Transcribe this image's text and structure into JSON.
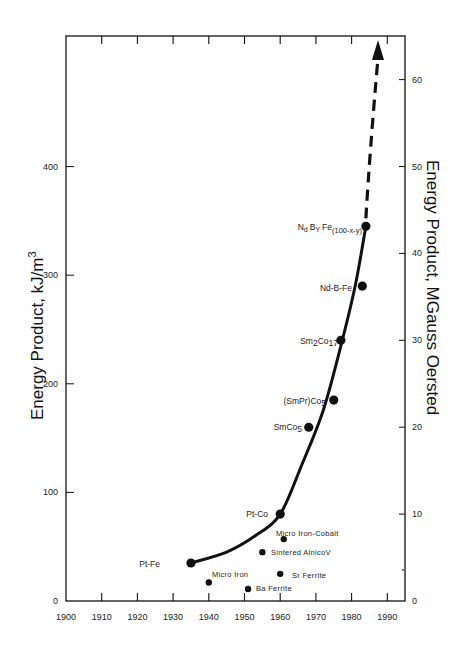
{
  "chart_data": {
    "type": "scatter",
    "title": "",
    "xlabel": "",
    "ylabel": "Energy Product, kJ/m³",
    "ylabel_base": "Energy Product, kJ/m",
    "ylabel_sup": "3",
    "ylabel_right": "Energy Product, MGauss Oersted",
    "xlim": [
      1900,
      1995
    ],
    "ylim": [
      0,
      520
    ],
    "ylim_right": [
      0,
      65
    ],
    "grid": false,
    "legend": "none",
    "x_ticks": [
      1900,
      1910,
      1920,
      1930,
      1940,
      1950,
      1960,
      1970,
      1980,
      1990
    ],
    "y_ticks_left": [
      0,
      100,
      200,
      300,
      400
    ],
    "y_ticks_right": [
      0,
      10,
      20,
      30,
      40,
      50,
      60
    ],
    "series": [
      {
        "name": "Trend curve materials",
        "on_curve": true,
        "points": [
          {
            "label": "Pt-Fe",
            "x": 1935,
            "y": 35
          },
          {
            "label": "Pt-Co",
            "x": 1960,
            "y": 80
          },
          {
            "label": "SmCo5",
            "label_main": "SmCo",
            "label_sub": "5",
            "x": 1968,
            "y": 160
          },
          {
            "label": "(SmPr)Co5",
            "label_main": "(SmPr)Co",
            "label_sub": "5",
            "x": 1975,
            "y": 185
          },
          {
            "label": "Sm2Co17",
            "label_a": "Sm",
            "label_sub1": "2",
            "label_b": "Co",
            "label_sub2": "17",
            "x": 1977,
            "y": 240
          },
          {
            "label": "Nd-B-Fe",
            "x": 1983,
            "y": 290
          },
          {
            "label": "NdBYFe(100-x-y)",
            "x": 1984,
            "y": 345
          }
        ]
      },
      {
        "name": "Other materials",
        "on_curve": false,
        "points": [
          {
            "label": "Micro Iron-Cobalt",
            "x": 1961,
            "y": 57
          },
          {
            "label": "Sintered AlnicoV",
            "x": 1955,
            "y": 45
          },
          {
            "label": "Sr Ferrite",
            "x": 1960,
            "y": 25
          },
          {
            "label": "Micro Iron",
            "x": 1940,
            "y": 17
          },
          {
            "label": "Ba Ferrite",
            "x": 1951,
            "y": 11
          }
        ]
      }
    ],
    "annotations": [
      {
        "type": "solid-curve",
        "from": [
          1935,
          35
        ],
        "to": [
          1984,
          345
        ]
      },
      {
        "type": "dashed-arrow",
        "from": [
          1984,
          345
        ],
        "to": [
          1986,
          520
        ],
        "meaning": "projected future growth"
      }
    ]
  },
  "labels": {
    "ndbfe": {
      "n": "N",
      "d": "d",
      "b": "B",
      "y": "Y",
      "fe": "Fe",
      "sub": "(100-x-y)"
    }
  }
}
